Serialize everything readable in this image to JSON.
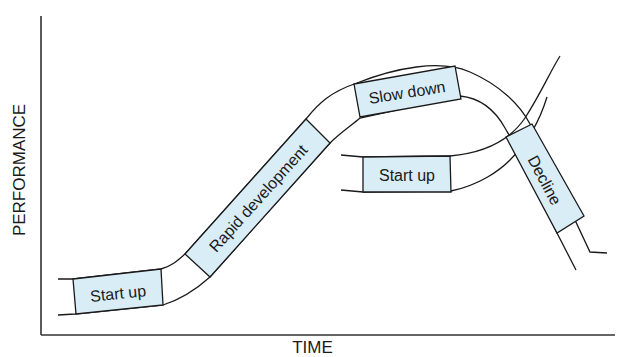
{
  "diagram": {
    "type": "s-curve lifecycle diagram",
    "y_axis_label": "PERFORMANCE",
    "x_axis_label": "TIME",
    "colors": {
      "stage_fill": "#d9edf7",
      "line": "#1a1a1a",
      "axis": "#333333",
      "background": "#ffffff"
    },
    "stages": [
      {
        "id": "startup-1",
        "label": "Start up",
        "curve": "first"
      },
      {
        "id": "rapid-development",
        "label": "Rapid development",
        "curve": "first"
      },
      {
        "id": "slow-down",
        "label": "Slow down",
        "curve": "first"
      },
      {
        "id": "decline",
        "label": "Decline",
        "curve": "first"
      },
      {
        "id": "startup-2",
        "label": "Start up",
        "curve": "second"
      }
    ]
  }
}
